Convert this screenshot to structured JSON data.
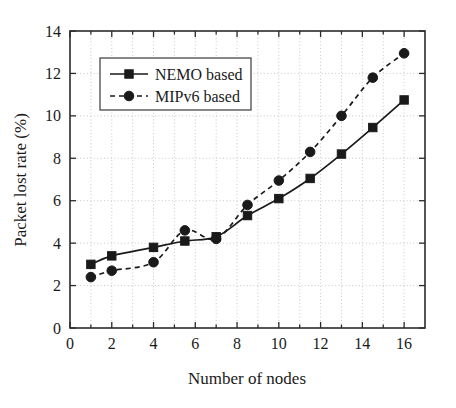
{
  "chart_data": {
    "type": "line",
    "title": "",
    "xlabel": "Number of nodes",
    "ylabel": "Packet lost rate (%)",
    "xlim": [
      0,
      17
    ],
    "ylim": [
      0,
      14
    ],
    "xticks": [
      0,
      2,
      4,
      6,
      8,
      10,
      12,
      14,
      16
    ],
    "yticks": [
      0,
      2,
      4,
      6,
      8,
      10,
      12,
      14
    ],
    "xtick_labels": [
      "0",
      "2",
      "4",
      "6",
      "8",
      "10",
      "12",
      "14",
      "16"
    ],
    "ytick_labels": [
      "0",
      "2",
      "4",
      "6",
      "8",
      "10",
      "12",
      "14"
    ],
    "grid": true,
    "grid_style": "dotted",
    "legend_position": "upper left",
    "series": [
      {
        "name": "NEMO based",
        "marker": "square",
        "linestyle": "solid",
        "color": "#1a1a1a",
        "x": [
          1,
          2,
          4,
          5.5,
          7,
          8.5,
          10,
          11.5,
          13,
          14.5,
          16
        ],
        "values": [
          3.0,
          3.4,
          3.8,
          4.1,
          4.3,
          5.3,
          6.1,
          7.05,
          8.2,
          9.45,
          10.75
        ]
      },
      {
        "name": "MIPv6 based",
        "marker": "circle",
        "linestyle": "dashed",
        "color": "#1a1a1a",
        "x": [
          1,
          2,
          4,
          5.5,
          7,
          8.5,
          10,
          11.5,
          13,
          14.5,
          16
        ],
        "values": [
          2.4,
          2.7,
          3.1,
          4.6,
          4.2,
          5.8,
          6.95,
          8.3,
          10.0,
          11.8,
          12.95
        ]
      }
    ]
  },
  "legend": {
    "entries": [
      {
        "label": "NEMO based"
      },
      {
        "label": "MIPv6 based"
      }
    ]
  },
  "axes": {
    "x_title": "Number of nodes",
    "y_title": "Packet lost rate (%)"
  }
}
